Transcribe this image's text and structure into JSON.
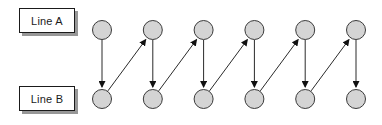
{
  "diagram": {
    "type": "node-link-diagram",
    "background": "#ffffff",
    "lines": [
      {
        "id": "A",
        "label": "Line A",
        "node_count": 6
      },
      {
        "id": "B",
        "label": "Line B",
        "node_count": 6
      }
    ],
    "nodes": [
      "A1",
      "A2",
      "A3",
      "A4",
      "A5",
      "A6",
      "B1",
      "B2",
      "B3",
      "B4",
      "B5",
      "B6"
    ],
    "edges": [
      {
        "from": "A1",
        "to": "B1"
      },
      {
        "from": "B1",
        "to": "A2"
      },
      {
        "from": "A2",
        "to": "B2"
      },
      {
        "from": "B2",
        "to": "A3"
      },
      {
        "from": "A3",
        "to": "B3"
      },
      {
        "from": "B3",
        "to": "A4"
      },
      {
        "from": "A4",
        "to": "B4"
      },
      {
        "from": "B4",
        "to": "A5"
      },
      {
        "from": "A5",
        "to": "B5"
      },
      {
        "from": "B5",
        "to": "A6"
      },
      {
        "from": "A6",
        "to": "B6"
      }
    ],
    "colors": {
      "node_fill": "#d4d4d4",
      "node_stroke": "#3a3a3a",
      "edge_stroke": "#2a2a2a",
      "arrowhead": "#111111",
      "box_border": "#1a1a1a",
      "box_shadow": "#979797"
    }
  }
}
